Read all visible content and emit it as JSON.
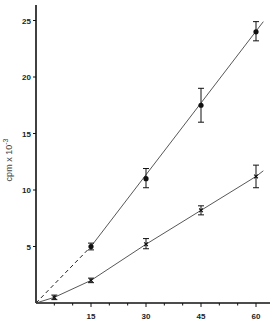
{
  "chart_data": {
    "type": "line",
    "title": "",
    "xlabel": "",
    "ylabel": "cpm x 10^-3",
    "ylabel_parts": {
      "base": "cpm x 10",
      "exp": "-3"
    },
    "xlim": [
      0,
      62
    ],
    "ylim": [
      0,
      26
    ],
    "x_ticks": [
      15,
      30,
      45,
      60
    ],
    "y_ticks": [
      5,
      10,
      15,
      20,
      25
    ],
    "grid": false,
    "legend": null,
    "series": [
      {
        "name": "upper (filled circles)",
        "marker": "filled-circle",
        "x": [
          15,
          30,
          45,
          60
        ],
        "y": [
          5.0,
          11.0,
          17.5,
          24.0
        ],
        "error_low": [
          4.7,
          10.2,
          16.0,
          23.2
        ],
        "error_high": [
          5.3,
          11.9,
          19.0,
          24.9
        ],
        "fit_line": "dashed from origin to 15, solid thereafter"
      },
      {
        "name": "lower (crosses)",
        "marker": "cross",
        "x": [
          5,
          15,
          30,
          45,
          60
        ],
        "y": [
          0.5,
          2.0,
          5.2,
          8.2,
          11.2
        ],
        "error_low": [
          0.3,
          1.8,
          4.8,
          7.8,
          10.2
        ],
        "error_high": [
          0.7,
          2.2,
          5.7,
          8.6,
          12.2
        ],
        "fit_line": "solid curve through origin"
      }
    ]
  }
}
